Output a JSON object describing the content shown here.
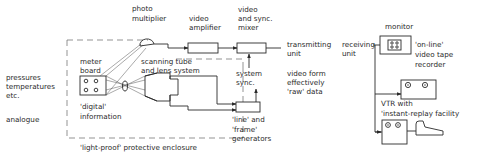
{
  "diagram": {
    "inputs": {
      "line1": "pressures",
      "line2": "temperatures",
      "line3": "etc.",
      "analogue": "analogue"
    },
    "meter_board": {
      "line1": "meter",
      "line2": "board",
      "digital1": "'digital'",
      "digital2": "information"
    },
    "photo_multiplier": {
      "line1": "photo",
      "line2": "multiplier"
    },
    "scanning_tube": {
      "line1": "scanning tube",
      "line2": "and lens system"
    },
    "video_amplifier": {
      "line1": "video",
      "line2": "amplifier"
    },
    "mixer": {
      "line1": "video",
      "line2": "and sync.",
      "line3": "mixer"
    },
    "system_sync": {
      "line1": "system",
      "line2": "sync."
    },
    "generators": {
      "line1": "'line' and",
      "line2": "'frame'",
      "line3": "generators"
    },
    "enclosure": {
      "label": "'light-proof' protective enclosure"
    },
    "transmitting_unit": {
      "line1": "transmitting",
      "line2": "unit"
    },
    "receiving_unit": {
      "line1": "receiving",
      "line2": "unit"
    },
    "video_form": {
      "line1": "video form",
      "line2": "effectively",
      "line3": "'raw' data"
    },
    "monitor": {
      "label": "monitor"
    },
    "online_vtr": {
      "line1": "'on-line'",
      "line2": "video tape",
      "line3": "recorder"
    },
    "replay_vtr": {
      "line1": "VTR with",
      "line2": "'instant-replay facility"
    }
  }
}
